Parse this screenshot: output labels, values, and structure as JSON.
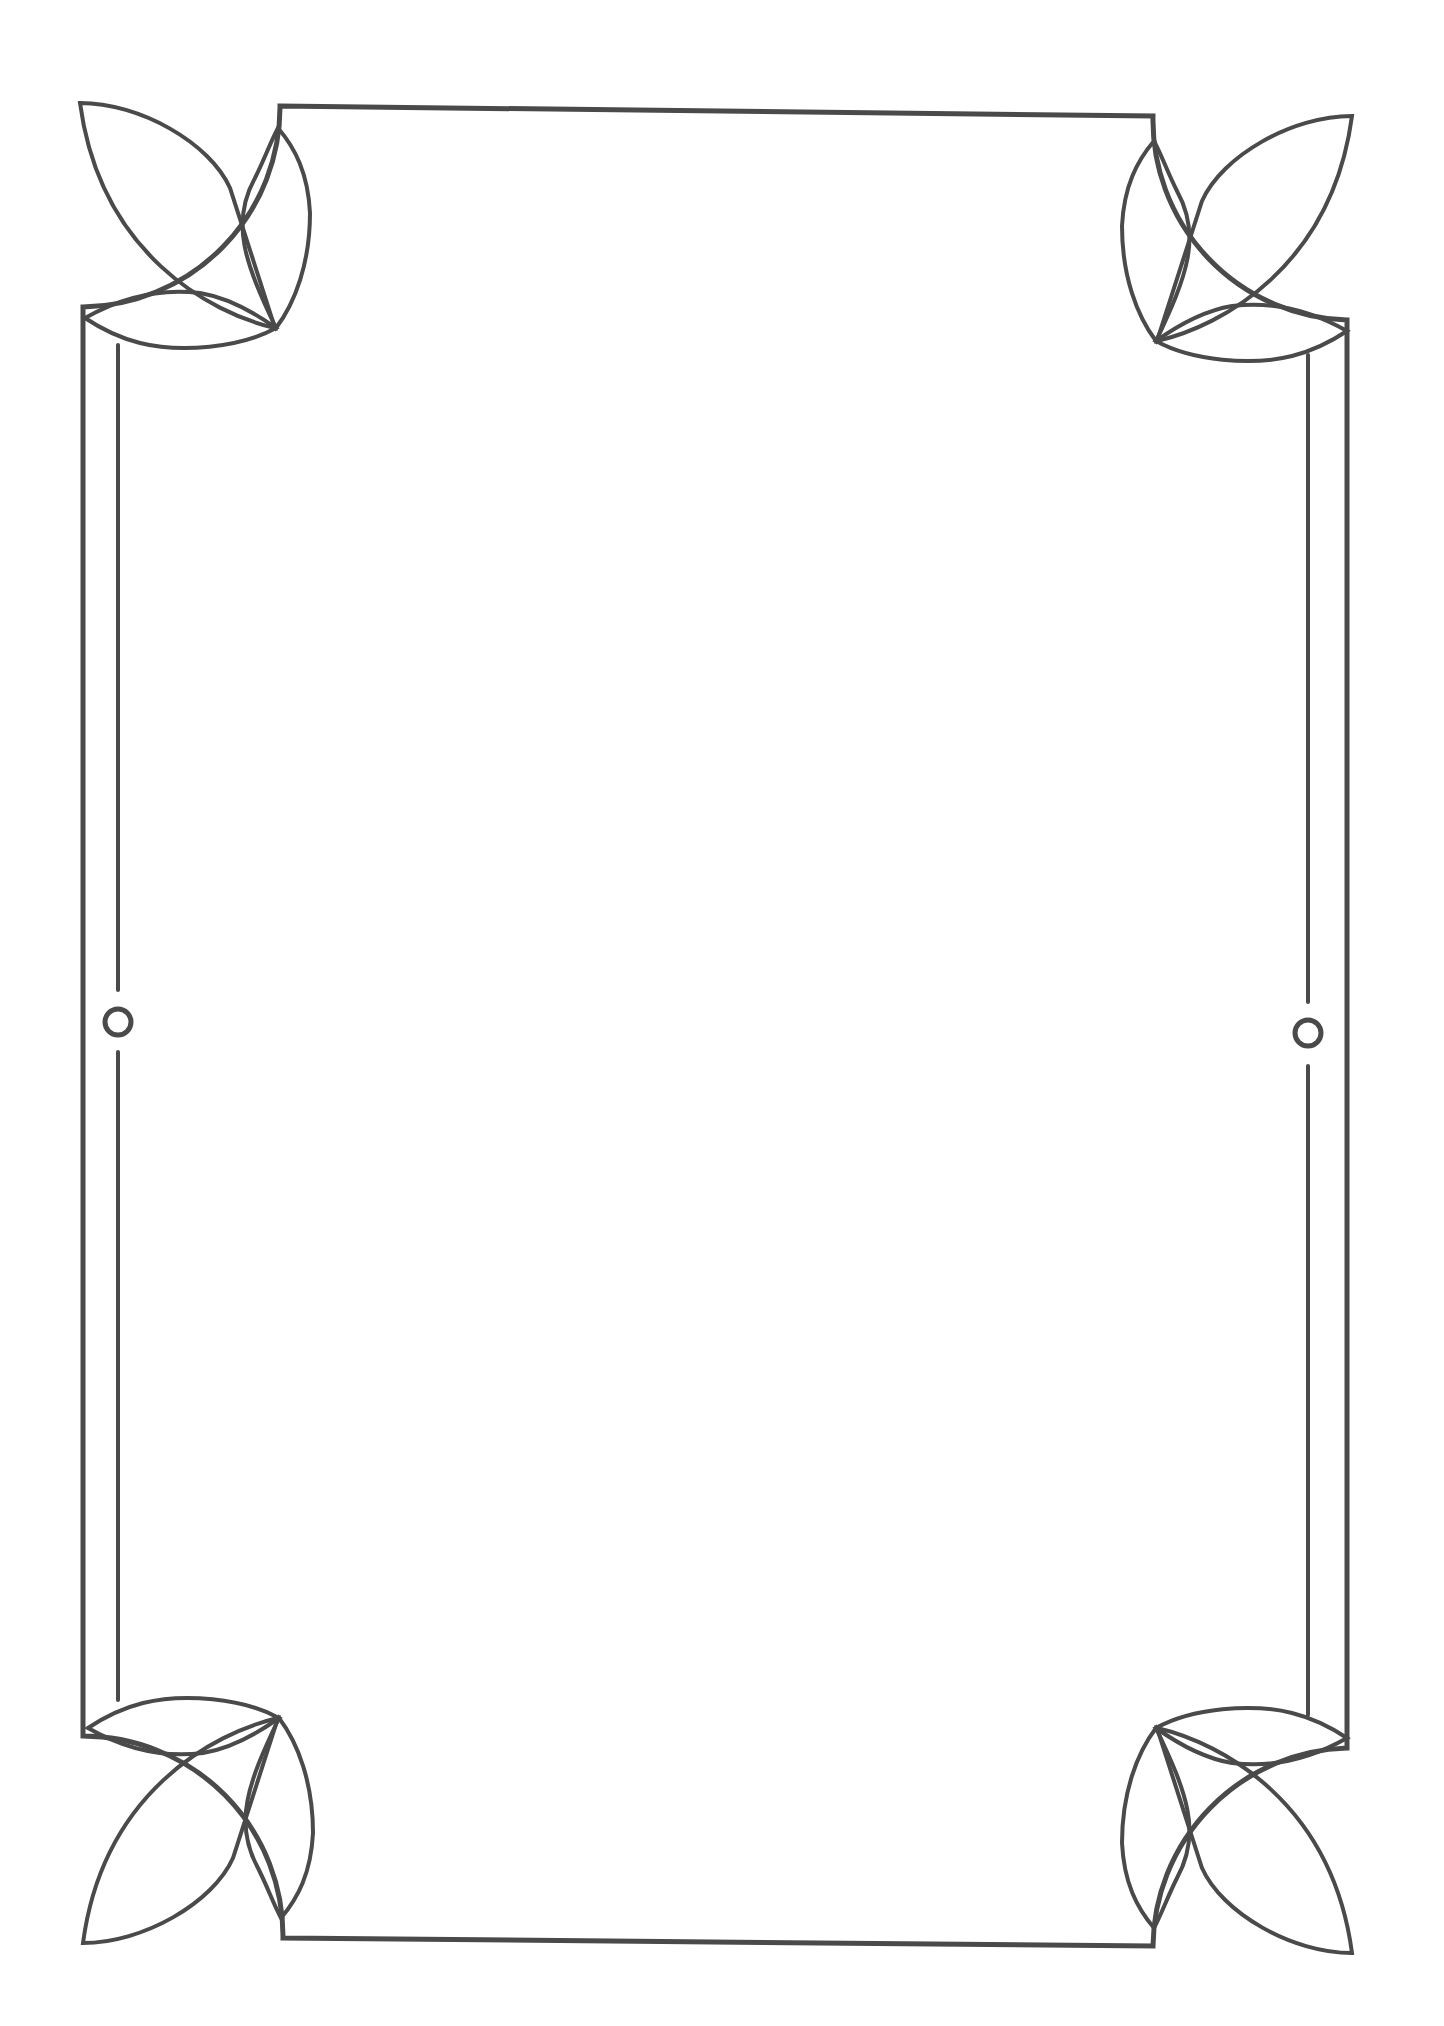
{
  "page": {
    "type": "decorative-border-frame",
    "background_color": "#ffffff",
    "stroke_color": "#4a4a4a",
    "body_text": ""
  },
  "ornaments": {
    "corners": [
      "top-left-leaf",
      "top-right-leaf",
      "bottom-left-leaf",
      "bottom-right-leaf"
    ],
    "side_circles": [
      "left-circle",
      "right-circle"
    ]
  }
}
